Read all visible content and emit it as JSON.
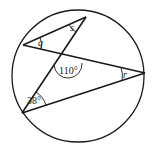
{
  "diagram": {
    "circle": {
      "cx": 78,
      "cy": 76,
      "r": 66
    },
    "points": {
      "A": {
        "x": 86,
        "y": 17
      },
      "B": {
        "x": 23,
        "y": 45
      },
      "C": {
        "x": 145,
        "y": 73
      },
      "D": {
        "x": 22,
        "y": 113
      }
    },
    "labels": {
      "q": "q",
      "s": "s",
      "r": "r",
      "angle_110": "110°",
      "angle_38": "38°"
    },
    "colors": {
      "stroke": "#1a1a1a",
      "background": "#ffffff"
    }
  }
}
